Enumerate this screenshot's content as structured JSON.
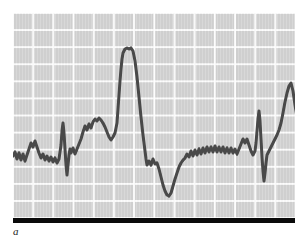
{
  "figure": {
    "panel_label": "a",
    "colors": {
      "page_background": "#ffffff",
      "plot_background": "#d3d3d3",
      "gridline": "#ffffff",
      "trace": "#4a4a4a",
      "scale_bar": "#0a0a0a"
    }
  },
  "chart_data": {
    "type": "line",
    "title": "",
    "subtitle": "",
    "xlabel": "",
    "ylabel": "",
    "xlim": [
      0,
      282
    ],
    "ylim": [
      0,
      205
    ],
    "grid": true,
    "grid_spacing_x": 20.2,
    "grid_spacing_y": 17.1,
    "legend": null,
    "legend_position": "none",
    "annotations": [
      {
        "text": "a",
        "role": "panel-label",
        "x": 0,
        "y": -12
      }
    ],
    "axis_visible": false,
    "tick_labels_x": [],
    "tick_labels_y": [],
    "series": [
      {
        "name": "trace",
        "color": "#4a4a4a",
        "line_width": 3,
        "points": [
          [
            0,
            143
          ],
          [
            2,
            139
          ],
          [
            4,
            146
          ],
          [
            6,
            140
          ],
          [
            8,
            147
          ],
          [
            10,
            141
          ],
          [
            12,
            148
          ],
          [
            14,
            142
          ],
          [
            16,
            136
          ],
          [
            18,
            130
          ],
          [
            20,
            134
          ],
          [
            22,
            128
          ],
          [
            24,
            134
          ],
          [
            26,
            140
          ],
          [
            28,
            145
          ],
          [
            30,
            141
          ],
          [
            32,
            147
          ],
          [
            34,
            143
          ],
          [
            36,
            148
          ],
          [
            38,
            144
          ],
          [
            40,
            149
          ],
          [
            42,
            145
          ],
          [
            44,
            150
          ],
          [
            46,
            146
          ],
          [
            48,
            132
          ],
          [
            49,
            118
          ],
          [
            50,
            110
          ],
          [
            51,
            120
          ],
          [
            52,
            136
          ],
          [
            53,
            152
          ],
          [
            54,
            162
          ],
          [
            55,
            152
          ],
          [
            56,
            142
          ],
          [
            57,
            136
          ],
          [
            58,
            140
          ],
          [
            60,
            135
          ],
          [
            62,
            141
          ],
          [
            64,
            136
          ],
          [
            66,
            131
          ],
          [
            68,
            126
          ],
          [
            70,
            119
          ],
          [
            72,
            113
          ],
          [
            74,
            117
          ],
          [
            76,
            111
          ],
          [
            78,
            115
          ],
          [
            80,
            109
          ],
          [
            82,
            106
          ],
          [
            84,
            108
          ],
          [
            86,
            105
          ],
          [
            88,
            107
          ],
          [
            90,
            110
          ],
          [
            92,
            114
          ],
          [
            94,
            119
          ],
          [
            96,
            124
          ],
          [
            98,
            127
          ],
          [
            100,
            124
          ],
          [
            102,
            120
          ],
          [
            104,
            110
          ],
          [
            105,
            96
          ],
          [
            106,
            82
          ],
          [
            107,
            68
          ],
          [
            108,
            56
          ],
          [
            109,
            46
          ],
          [
            110,
            40
          ],
          [
            112,
            36
          ],
          [
            114,
            35
          ],
          [
            116,
            36
          ],
          [
            118,
            35
          ],
          [
            120,
            38
          ],
          [
            122,
            48
          ],
          [
            124,
            64
          ],
          [
            126,
            84
          ],
          [
            128,
            104
          ],
          [
            130,
            122
          ],
          [
            132,
            138
          ],
          [
            133,
            146
          ],
          [
            134,
            152
          ],
          [
            136,
            148
          ],
          [
            138,
            152
          ],
          [
            140,
            146
          ],
          [
            142,
            151
          ],
          [
            144,
            150
          ],
          [
            146,
            156
          ],
          [
            148,
            164
          ],
          [
            150,
            172
          ],
          [
            152,
            178
          ],
          [
            154,
            182
          ],
          [
            156,
            183
          ],
          [
            158,
            180
          ],
          [
            160,
            173
          ],
          [
            162,
            166
          ],
          [
            164,
            160
          ],
          [
            166,
            154
          ],
          [
            168,
            150
          ],
          [
            170,
            147
          ],
          [
            172,
            145
          ],
          [
            174,
            141
          ],
          [
            176,
            144
          ],
          [
            178,
            138
          ],
          [
            180,
            143
          ],
          [
            182,
            137
          ],
          [
            184,
            142
          ],
          [
            186,
            136
          ],
          [
            188,
            141
          ],
          [
            190,
            135
          ],
          [
            192,
            140
          ],
          [
            194,
            134
          ],
          [
            196,
            139
          ],
          [
            198,
            134
          ],
          [
            200,
            139
          ],
          [
            202,
            133
          ],
          [
            204,
            139
          ],
          [
            206,
            134
          ],
          [
            208,
            139
          ],
          [
            210,
            134
          ],
          [
            212,
            140
          ],
          [
            214,
            135
          ],
          [
            216,
            140
          ],
          [
            218,
            135
          ],
          [
            220,
            140
          ],
          [
            222,
            136
          ],
          [
            224,
            141
          ],
          [
            226,
            136
          ],
          [
            228,
            131
          ],
          [
            230,
            126
          ],
          [
            232,
            130
          ],
          [
            234,
            126
          ],
          [
            236,
            132
          ],
          [
            238,
            138
          ],
          [
            240,
            142
          ],
          [
            242,
            138
          ],
          [
            243,
            130
          ],
          [
            244,
            118
          ],
          [
            245,
            106
          ],
          [
            246,
            98
          ],
          [
            247,
            108
          ],
          [
            248,
            126
          ],
          [
            249,
            144
          ],
          [
            250,
            158
          ],
          [
            251,
            168
          ],
          [
            252,
            160
          ],
          [
            253,
            150
          ],
          [
            254,
            142
          ],
          [
            256,
            138
          ],
          [
            258,
            134
          ],
          [
            260,
            130
          ],
          [
            262,
            126
          ],
          [
            264,
            122
          ],
          [
            266,
            117
          ],
          [
            268,
            110
          ],
          [
            270,
            100
          ],
          [
            272,
            89
          ],
          [
            274,
            80
          ],
          [
            276,
            73
          ],
          [
            278,
            70
          ],
          [
            280,
            78
          ],
          [
            282,
            92
          ],
          [
            284,
            104
          ],
          [
            286,
            114
          ],
          [
            288,
            122
          ],
          [
            290,
            130
          ],
          [
            292,
            135
          ],
          [
            294,
            138
          ]
        ]
      }
    ]
  }
}
